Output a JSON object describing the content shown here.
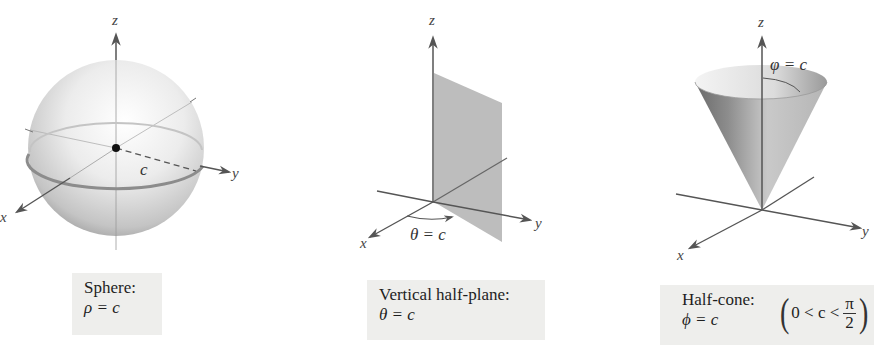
{
  "figures": [
    {
      "id": "sphere",
      "axes": {
        "x": "x",
        "y": "y",
        "z": "z"
      },
      "annotation": "c",
      "caption": {
        "title": "Sphere:",
        "equation": "ρ = c"
      }
    },
    {
      "id": "half-plane",
      "axes": {
        "x": "x",
        "y": "y",
        "z": "z"
      },
      "annotation": "θ = c",
      "caption": {
        "title": "Vertical half-plane:",
        "equation": "θ = c"
      }
    },
    {
      "id": "half-cone",
      "axes": {
        "x": "x",
        "y": "y",
        "z": "z"
      },
      "annotation": "φ = c",
      "caption": {
        "title": "Half-cone:",
        "equation": "ϕ = c",
        "condition": {
          "left": "0 < c <",
          "numerator": "π",
          "denominator": "2",
          "open": "(",
          "close": ")"
        }
      }
    }
  ],
  "colors": {
    "axis": "#555555",
    "caption_bg": "#eeeeec",
    "plane_fill": "#bdbdbd",
    "sphere_light": "#fafafa",
    "sphere_dark": "#8a8a8a"
  }
}
